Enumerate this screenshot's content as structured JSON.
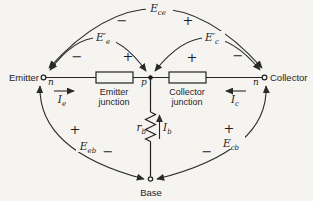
{
  "palette": {
    "paper": "#f5f4f1",
    "ink": "#1d1d1d"
  },
  "terminals": {
    "emitter": {
      "label": "Emitter",
      "region": "n"
    },
    "collector": {
      "label": "Collector",
      "region": "n"
    },
    "base": {
      "label": "Base"
    },
    "midpoint": {
      "label": "p"
    }
  },
  "junctions": {
    "emitter": {
      "line1": "Emitter",
      "line2": "junction"
    },
    "collector": {
      "line1": "Collector",
      "line2": "junction"
    }
  },
  "resistor": {
    "symbol": "r",
    "sub": "b"
  },
  "currents": {
    "ie": {
      "symbol": "I",
      "sub": "e"
    },
    "ic": {
      "symbol": "I",
      "sub": "c"
    },
    "ib": {
      "symbol": "I",
      "sub": "b"
    }
  },
  "voltages": {
    "ece": {
      "symbol": "E",
      "sub": "ce",
      "sign_left": "−",
      "sign_right": "+"
    },
    "eep": {
      "symbol": "E′",
      "sub": "e",
      "sign_left": "−",
      "sign_right": "+"
    },
    "ecp": {
      "symbol": "E′",
      "sub": "c",
      "sign_left": "+",
      "sign_right": "−"
    },
    "eeb": {
      "symbol": "E",
      "sub": "eb",
      "sign_plus": "+",
      "sign_minus": "−"
    },
    "ecb": {
      "symbol": "E",
      "sub": "cb",
      "sign_plus": "+",
      "sign_minus": "−"
    }
  }
}
